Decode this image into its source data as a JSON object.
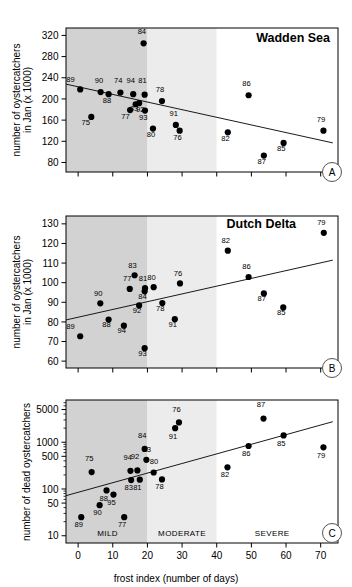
{
  "figure": {
    "xlabel": "frost index (number of days)",
    "xticks": [
      0,
      10,
      20,
      30,
      40,
      50,
      60,
      70
    ],
    "xlim": [
      -3.5,
      75
    ],
    "bands": [
      {
        "name": "MILD",
        "from": -3.5,
        "to": 20,
        "color": "#d2d2d2",
        "label": "MILD",
        "label_x": 8.5
      },
      {
        "name": "MODERATE",
        "from": 20,
        "to": 40,
        "color": "#ececec",
        "label": "MODERATE",
        "label_x": 30
      },
      {
        "name": "SEVERE",
        "from": 40,
        "to": 75,
        "color": "#ffffff",
        "label": "SEVERE",
        "label_x": 56
      }
    ]
  },
  "chart_data": [
    {
      "type": "scatter",
      "panel": "A",
      "title": "Wadden Sea",
      "ylabel": "number of oystercatchers\nin Jan (x 1000)",
      "xlabel": "frost index (number of days)",
      "yscale": "linear",
      "ylim": [
        62,
        334
      ],
      "yticks": [
        80,
        120,
        160,
        200,
        240,
        280,
        320
      ],
      "xlim": [
        -3.5,
        75
      ],
      "grid": false,
      "points": [
        {
          "label": "89",
          "x": 0.6,
          "y": 218,
          "lx": -2.2,
          "ly": 232
        },
        {
          "label": "75",
          "x": 3.8,
          "y": 166,
          "lx": 2.2,
          "ly": 150
        },
        {
          "label": "90",
          "x": 6.5,
          "y": 213,
          "lx": 6.0,
          "ly": 230
        },
        {
          "label": "88",
          "x": 8.8,
          "y": 209,
          "lx": 8.3,
          "ly": 192
        },
        {
          "label": "74",
          "x": 12.2,
          "y": 212,
          "lx": 11.6,
          "ly": 230
        },
        {
          "label": "77",
          "x": 15.0,
          "y": 179,
          "lx": 13.7,
          "ly": 162
        },
        {
          "label": "83",
          "x": 16.6,
          "y": 190,
          "lx": 16.1,
          "ly": 177
        },
        {
          "label": "94",
          "x": 15.9,
          "y": 209,
          "lx": 15.2,
          "ly": 231
        },
        {
          "label": "92",
          "x": 17.6,
          "y": 192,
          "lx": 17.9,
          "ly": 176
        },
        {
          "label": "93",
          "x": 19.3,
          "y": 178,
          "lx": 18.8,
          "ly": 160
        },
        {
          "label": "81",
          "x": 19.2,
          "y": 208,
          "lx": 18.6,
          "ly": 231
        },
        {
          "label": "84",
          "x": 18.9,
          "y": 305,
          "lx": 18.4,
          "ly": 322
        },
        {
          "label": "80",
          "x": 21.6,
          "y": 144,
          "lx": 21.0,
          "ly": 128
        },
        {
          "label": "78",
          "x": 24.2,
          "y": 196,
          "lx": 23.6,
          "ly": 214
        },
        {
          "label": "91",
          "x": 28.2,
          "y": 151,
          "lx": 27.6,
          "ly": 167
        },
        {
          "label": "76",
          "x": 29.3,
          "y": 140,
          "lx": 28.7,
          "ly": 123
        },
        {
          "label": "82",
          "x": 43.2,
          "y": 137,
          "lx": 42.5,
          "ly": 121
        },
        {
          "label": "86",
          "x": 49.2,
          "y": 207,
          "lx": 48.6,
          "ly": 224
        },
        {
          "label": "87",
          "x": 53.6,
          "y": 93,
          "lx": 53.0,
          "ly": 78
        },
        {
          "label": "85",
          "x": 59.3,
          "y": 117,
          "lx": 58.6,
          "ly": 101
        },
        {
          "label": "79",
          "x": 70.8,
          "y": 140,
          "lx": 70.1,
          "ly": 157
        }
      ],
      "trendline": {
        "x1": -3.5,
        "y1": 228,
        "x2": 73.5,
        "y2": 117
      }
    },
    {
      "type": "scatter",
      "panel": "B",
      "title": "Dutch Delta",
      "ylabel": "number of oystercatchers\nin Jan (x 1000)",
      "xlabel": "frost index (number of days)",
      "yscale": "linear",
      "ylim": [
        56.5,
        134
      ],
      "yticks": [
        60,
        70,
        80,
        90,
        100,
        110,
        120,
        130
      ],
      "xlim": [
        -3.5,
        75
      ],
      "grid": false,
      "points": [
        {
          "label": "89",
          "x": 0.6,
          "y": 72.7,
          "lx": -2.2,
          "ly": 76.5
        },
        {
          "label": "90",
          "x": 6.4,
          "y": 89.5,
          "lx": 5.8,
          "ly": 93.4
        },
        {
          "label": "88",
          "x": 8.8,
          "y": 81.2,
          "lx": 8.2,
          "ly": 77.4
        },
        {
          "label": "94",
          "x": 13.2,
          "y": 78.1,
          "lx": 12.6,
          "ly": 74.3
        },
        {
          "label": "77",
          "x": 14.9,
          "y": 96.8,
          "lx": 14.2,
          "ly": 100.7
        },
        {
          "label": "83",
          "x": 16.3,
          "y": 103.8,
          "lx": 15.7,
          "ly": 107.7
        },
        {
          "label": "92",
          "x": 17.6,
          "y": 88.4,
          "lx": 17.0,
          "ly": 84.4
        },
        {
          "label": "84",
          "x": 19.2,
          "y": 95.6,
          "lx": 18.6,
          "ly": 91.6
        },
        {
          "label": "81",
          "x": 19.3,
          "y": 97.2,
          "lx": 18.7,
          "ly": 101.0
        },
        {
          "label": "93",
          "x": 19.2,
          "y": 66.6,
          "lx": 18.6,
          "ly": 62.6
        },
        {
          "label": "80",
          "x": 21.8,
          "y": 97.7,
          "lx": 21.2,
          "ly": 101.6
        },
        {
          "label": "78",
          "x": 24.3,
          "y": 89.6,
          "lx": 23.7,
          "ly": 85.5
        },
        {
          "label": "91",
          "x": 27.9,
          "y": 81.4,
          "lx": 27.3,
          "ly": 77.3
        },
        {
          "label": "76",
          "x": 29.4,
          "y": 99.6,
          "lx": 28.8,
          "ly": 103.5
        },
        {
          "label": "82",
          "x": 43.2,
          "y": 116.3,
          "lx": 42.6,
          "ly": 120.2
        },
        {
          "label": "86",
          "x": 49.2,
          "y": 102.9,
          "lx": 48.6,
          "ly": 106.8
        },
        {
          "label": "87",
          "x": 53.6,
          "y": 94.5,
          "lx": 53.0,
          "ly": 90.5
        },
        {
          "label": "85",
          "x": 59.2,
          "y": 87.4,
          "lx": 58.6,
          "ly": 83.4
        },
        {
          "label": "79",
          "x": 70.9,
          "y": 125.4,
          "lx": 70.2,
          "ly": 129.4
        }
      ],
      "trendline": {
        "x1": -3.5,
        "y1": 81.0,
        "x2": 73.5,
        "y2": 111.5
      }
    },
    {
      "type": "scatter",
      "panel": "C",
      "title": "",
      "ylabel": "number of dead oystercatchers",
      "xlabel": "frost index (number of days)",
      "yscale": "log",
      "ylim": [
        7,
        8000
      ],
      "yticks": [
        10,
        50,
        100,
        500,
        1000,
        5000
      ],
      "minorticks": [
        20,
        30,
        40,
        60,
        70,
        80,
        90,
        200,
        300,
        400,
        600,
        700,
        800,
        900,
        2000,
        3000,
        4000,
        6000,
        7000
      ],
      "xlim": [
        -3.5,
        75
      ],
      "grid": false,
      "points": [
        {
          "label": "89",
          "x": 0.9,
          "y": 25,
          "lx": 0.2,
          "ly": 15.5
        },
        {
          "label": "75",
          "x": 3.9,
          "y": 230,
          "lx": 3.2,
          "ly": 400
        },
        {
          "label": "90",
          "x": 6.2,
          "y": 45,
          "lx": 5.6,
          "ly": 28
        },
        {
          "label": "88",
          "x": 8.2,
          "y": 93,
          "lx": 7.4,
          "ly": 56
        },
        {
          "label": "95",
          "x": 10.2,
          "y": 76,
          "lx": 9.6,
          "ly": 46
        },
        {
          "label": "77",
          "x": 13.3,
          "y": 25,
          "lx": 12.7,
          "ly": 15.5
        },
        {
          "label": "94",
          "x": 15.1,
          "y": 245,
          "lx": 14.3,
          "ly": 420
        },
        {
          "label": "83",
          "x": 15.3,
          "y": 155,
          "lx": 14.6,
          "ly": 95
        },
        {
          "label": "92",
          "x": 17.1,
          "y": 250,
          "lx": 16.4,
          "ly": 430
        },
        {
          "label": "81",
          "x": 17.8,
          "y": 158,
          "lx": 17.1,
          "ly": 96
        },
        {
          "label": "84",
          "x": 19.2,
          "y": 720,
          "lx": 18.5,
          "ly": 1250
        },
        {
          "label": "93",
          "x": 19.7,
          "y": 420,
          "lx": 19.8,
          "ly": 620
        },
        {
          "label": "80",
          "x": 21.8,
          "y": 225,
          "lx": 21.9,
          "ly": 340
        },
        {
          "label": "78",
          "x": 24.2,
          "y": 160,
          "lx": 23.5,
          "ly": 98
        },
        {
          "label": "91",
          "x": 28.0,
          "y": 2000,
          "lx": 27.4,
          "ly": 1200
        },
        {
          "label": "76",
          "x": 29.1,
          "y": 2650,
          "lx": 28.4,
          "ly": 4400
        },
        {
          "label": "82",
          "x": 43.1,
          "y": 290,
          "lx": 42.4,
          "ly": 180
        },
        {
          "label": "86",
          "x": 49.2,
          "y": 830,
          "lx": 48.5,
          "ly": 500
        },
        {
          "label": "87",
          "x": 53.5,
          "y": 3200,
          "lx": 52.8,
          "ly": 5600
        },
        {
          "label": "85",
          "x": 59.3,
          "y": 1400,
          "lx": 58.6,
          "ly": 850
        },
        {
          "label": "79",
          "x": 70.8,
          "y": 780,
          "lx": 70.1,
          "ly": 470
        }
      ],
      "trendline": {
        "x1": -3.5,
        "y1": 72,
        "x2": 73.5,
        "y2": 2750
      }
    }
  ],
  "panel_letters": {
    "a": "A",
    "b": "B",
    "c": "C"
  }
}
